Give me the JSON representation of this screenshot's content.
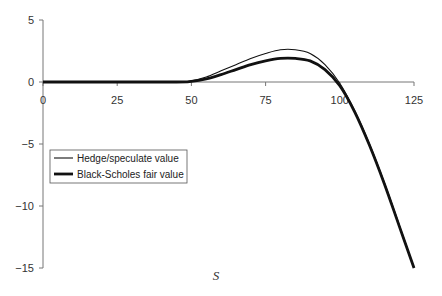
{
  "chart_data": {
    "type": "line",
    "title": "",
    "xlabel": "S",
    "ylabel": "",
    "xlim": [
      0,
      125
    ],
    "ylim": [
      -15,
      5
    ],
    "x_ticks": [
      "0",
      "25",
      "50",
      "75",
      "100",
      "125"
    ],
    "y_ticks": [
      "5",
      "0",
      "-5",
      "-10",
      "-15"
    ],
    "grid": false,
    "legend_position": "left-middle",
    "x": [
      0,
      25,
      45,
      50,
      55,
      60,
      65,
      70,
      75,
      80,
      85,
      90,
      95,
      100,
      105,
      110,
      115,
      120,
      125
    ],
    "series": [
      {
        "name": "Hedge/speculate value",
        "style": "thin",
        "values": [
          0,
          0,
          0,
          0.1,
          0.4,
          0.9,
          1.4,
          1.9,
          2.3,
          2.6,
          2.6,
          2.3,
          1.4,
          -0.1,
          -2.3,
          -5.0,
          -8.1,
          -11.5,
          -15.0
        ]
      },
      {
        "name": "Black-Scholes fair value",
        "style": "thick",
        "values": [
          0,
          0,
          0,
          0.05,
          0.25,
          0.6,
          1.0,
          1.4,
          1.7,
          1.9,
          1.9,
          1.7,
          1.0,
          -0.3,
          -2.4,
          -5.1,
          -8.2,
          -11.6,
          -15.0
        ]
      }
    ]
  },
  "legend": {
    "items": [
      "Hedge/speculate value",
      "Black-Scholes fair value"
    ]
  },
  "axis": {
    "xlabel": "S"
  }
}
